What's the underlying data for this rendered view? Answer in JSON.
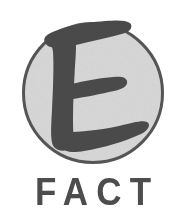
{
  "logo": {
    "name": "E FACT logo",
    "emblem": {
      "name": "circular-e-emblem",
      "shape": "circle",
      "letter": "E",
      "style": "hand-drawn brush serif capital",
      "fill_color": "#dcdcdc",
      "outline_color": "#555555",
      "letter_color": "#4a4a4a",
      "outline_width_px": 3,
      "center_x": 93,
      "center_y": 93,
      "radius_px": 71
    },
    "wordmark": {
      "name": "fact-wordmark",
      "text": "FACT",
      "color": "#4d4d4d",
      "weight": "bold",
      "letter_spacing_px": 9,
      "font_size_px": 38
    },
    "background_color": "#ffffff",
    "canvas": {
      "width": 186,
      "height": 223
    }
  }
}
